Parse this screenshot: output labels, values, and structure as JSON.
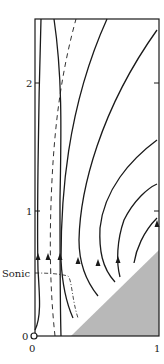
{
  "figure": {
    "title": "",
    "x_axis": {
      "ticks": [
        {
          "label": "0",
          "value": 0
        },
        {
          "label": "1",
          "value": 1
        }
      ]
    },
    "y_axis": {
      "ticks": [
        {
          "label": "0",
          "value": 0
        },
        {
          "label": "1",
          "value": 1
        },
        {
          "label": "2",
          "value": 2
        }
      ]
    },
    "annotations": {
      "sonic_label": "Sonic"
    },
    "colors": {
      "ink": "#1a1a1a",
      "shaded_region": "#b8b8b8",
      "background": "#ffffff"
    },
    "frame": {
      "left": 35,
      "right": 159,
      "top": 19,
      "bottom": 336
    },
    "streamlines_solid": [
      "M 35 330 C 41 318, 40 300, 38 270 C 37 230, 38 120, 41 19",
      "M 61 336 C 60 300, 60 240, 60 200 C 61 140, 63 80, 54 19",
      "M 73 318 C 65 300, 62 280, 61 260 C 61 200, 66 110, 107 19",
      "M 98 296 C 85 280, 79 262, 79 240 C 80 190, 100 110, 157 30",
      "M 115 282 C 102 268, 99 250, 100 228 C 104 190, 130 160, 157 140",
      "M 120 277 C 116 262, 117 240, 124 220 C 134 200, 148 188, 157 184",
      "M 134 263 C 136 250, 143 232, 157 218"
    ],
    "dashed_line": "M 55 336 C 50 290, 49 240, 52 180 C 55 120, 62 70, 76 19",
    "sonic_line": "M 35 273 C 50 273, 60 274, 68 276 C 72 280, 72 300, 78 318",
    "shaded_triangle": "71,336 159,336 159,250",
    "arrows": [
      {
        "x": 38,
        "y": 258
      },
      {
        "x": 48,
        "y": 258
      },
      {
        "x": 60,
        "y": 258
      },
      {
        "x": 78,
        "y": 262
      },
      {
        "x": 98,
        "y": 264
      },
      {
        "x": 118,
        "y": 261
      },
      {
        "x": 157,
        "y": 225
      }
    ]
  }
}
